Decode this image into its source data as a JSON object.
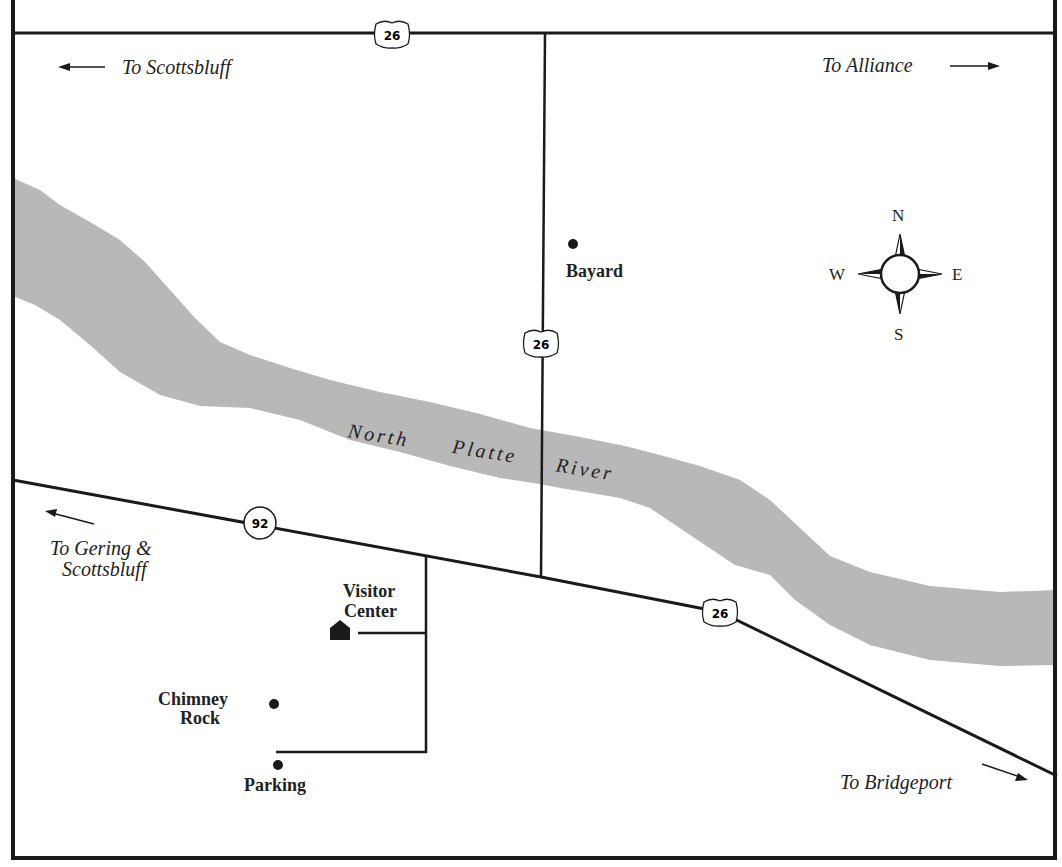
{
  "map": {
    "colors": {
      "river": "#b8b8b8",
      "road": "#1a1a1a",
      "background": "#ffffff"
    },
    "river": {
      "name_words": [
        "North",
        "Platte",
        "River"
      ]
    },
    "directions": {
      "to_scottsbluff": "To Scottsbluff",
      "to_alliance": "To Alliance",
      "to_gering_line1": "To Gering &",
      "to_gering_line2": "Scottsbluff",
      "to_bridgeport": "To Bridgeport"
    },
    "places": {
      "bayard": "Bayard",
      "visitor_center_line1": "Visitor",
      "visitor_center_line2": "Center",
      "chimney_rock_line1": "Chimney",
      "chimney_rock_line2": "Rock",
      "parking": "Parking"
    },
    "route_shields": {
      "us26_top": "26",
      "us26_mid": "26",
      "us26_bottom": "26",
      "ne92": "92"
    },
    "compass": {
      "n": "N",
      "s": "S",
      "e": "E",
      "w": "W"
    }
  }
}
